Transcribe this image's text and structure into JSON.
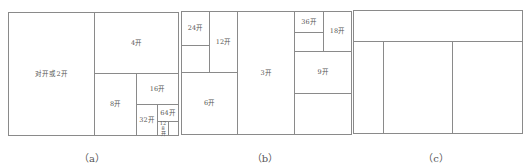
{
  "panels": {
    "a": {
      "caption": "（a）",
      "cells": {
        "folio": "对开或2开",
        "quarto": "4开",
        "octavo": "8开",
        "c16": "16开",
        "c32": "32开",
        "c64": "64开",
        "c128": "128开"
      }
    },
    "b": {
      "caption": "（b）",
      "cells": {
        "c24": "24开",
        "c12": "12开",
        "c6": "6开",
        "c3": "3开",
        "c36": "36开",
        "c18": "18开",
        "c9": "9开"
      }
    },
    "c": {
      "caption": "（c）"
    }
  },
  "colors": {
    "line": "#8a8a8a",
    "text": "#555555"
  }
}
